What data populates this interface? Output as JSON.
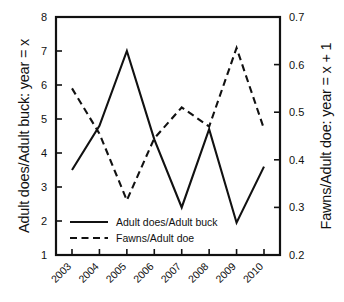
{
  "chart_data": {
    "type": "line",
    "title": "",
    "xlabel": "",
    "ylabel": "Adult does/Adult buck: year = x",
    "ylabel_right": "Fawns/Adult doe: year = x + 1",
    "categories": [
      "2003",
      "2004",
      "2005",
      "2006",
      "2007",
      "2008",
      "2009",
      "2010"
    ],
    "ylim": [
      1,
      8
    ],
    "yticks": [
      "1",
      "2",
      "3",
      "4",
      "5",
      "6",
      "7",
      "8"
    ],
    "ylim_right": [
      0.2,
      0.7
    ],
    "yticks_right": [
      "0.2",
      "0.3",
      "0.4",
      "0.5",
      "0.6",
      "0.7"
    ],
    "grid": false,
    "legend_position": "lower-left-inside",
    "series": [
      {
        "name": "Adult does/Adult buck",
        "axis": "left",
        "style": "solid",
        "color": "#111111",
        "values": [
          3.5,
          4.8,
          7.0,
          4.4,
          2.4,
          4.7,
          1.95,
          3.6
        ]
      },
      {
        "name": "Fawns/Adult doe",
        "axis": "right",
        "style": "dashed",
        "color": "#111111",
        "values": [
          0.55,
          0.455,
          0.315,
          0.445,
          0.51,
          0.47,
          0.635,
          0.465
        ]
      }
    ]
  },
  "legend": {
    "items": [
      {
        "label": "Adult does/Adult buck",
        "style": "solid"
      },
      {
        "label": "Fawns/Adult doe",
        "style": "dashed"
      }
    ]
  }
}
